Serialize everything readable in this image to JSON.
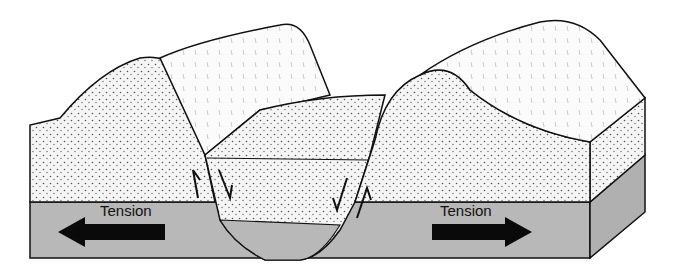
{
  "diagram": {
    "type": "rift-valley-block-diagram",
    "labels": {
      "left_force": "Tension",
      "right_force": "Tension"
    },
    "colors": {
      "stipple_fill": "#f4f4f4",
      "dot": "#555555",
      "base_layer": "#b8b8b8",
      "outline": "#111111",
      "arrow": "#0a0a0a"
    },
    "features": [
      "left-horst-block",
      "central-graben",
      "right-horst-block",
      "fault-left",
      "fault-right",
      "tension-arrow-left",
      "tension-arrow-right"
    ]
  }
}
